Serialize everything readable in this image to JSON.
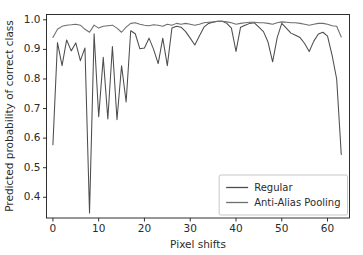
{
  "figure": {
    "background": "#ffffff",
    "axes_color": "#1a1a1a",
    "text_color": "#2b2b2b"
  },
  "chart_data": {
    "type": "line",
    "title": "",
    "xlabel": "Pixel shifts",
    "ylabel": "Predicted probability of correct class",
    "xlim": [
      -1.4,
      64.8
    ],
    "ylim": [
      0.33,
      1.018
    ],
    "xticks": [
      0,
      10,
      20,
      30,
      40,
      50,
      60
    ],
    "xticklabels": [
      "0",
      "10",
      "20",
      "30",
      "40",
      "50",
      "60"
    ],
    "yticks": [
      0.4,
      0.5,
      0.6,
      0.7,
      0.8,
      0.9,
      1.0
    ],
    "yticklabels": [
      "0.4",
      "0.5",
      "0.6",
      "0.7",
      "0.8",
      "0.9",
      "1.0"
    ],
    "grid": false,
    "legend_position": "lower right",
    "x": [
      0,
      1,
      2,
      3,
      4,
      5,
      6,
      7,
      8,
      9,
      10,
      11,
      12,
      13,
      14,
      15,
      16,
      17,
      18,
      19,
      20,
      21,
      22,
      23,
      24,
      25,
      26,
      27,
      28,
      29,
      30,
      31,
      32,
      33,
      34,
      35,
      36,
      37,
      38,
      39,
      40,
      41,
      42,
      43,
      44,
      45,
      46,
      47,
      48,
      49,
      50,
      51,
      52,
      53,
      54,
      55,
      56,
      57,
      58,
      59,
      60,
      61,
      62,
      63
    ],
    "series": [
      {
        "name": "Regular",
        "color": "#4d4d4d",
        "values": [
          0.578,
          0.923,
          0.845,
          0.932,
          0.895,
          0.922,
          0.862,
          0.905,
          0.347,
          0.953,
          0.672,
          0.873,
          0.665,
          0.91,
          0.662,
          0.845,
          0.722,
          0.963,
          0.953,
          0.902,
          0.905,
          0.938,
          0.9,
          0.852,
          0.938,
          0.845,
          0.972,
          0.978,
          0.975,
          0.96,
          0.938,
          0.915,
          0.945,
          0.975,
          0.988,
          0.992,
          0.995,
          0.995,
          0.988,
          0.972,
          0.893,
          0.975,
          0.982,
          0.988,
          0.99,
          0.975,
          0.96,
          0.925,
          0.858,
          0.94,
          0.988,
          0.972,
          0.955,
          0.948,
          0.94,
          0.92,
          0.893,
          0.928,
          0.952,
          0.958,
          0.945,
          0.88,
          0.8,
          0.545
        ],
        "legend_label": "Regular"
      },
      {
        "name": "Anti-Alias Pooling",
        "color": "#6e6e6e",
        "values": [
          0.94,
          0.968,
          0.978,
          0.982,
          0.983,
          0.985,
          0.982,
          0.968,
          0.958,
          0.982,
          0.972,
          0.978,
          0.98,
          0.982,
          0.972,
          0.958,
          0.975,
          0.988,
          0.99,
          0.985,
          0.982,
          0.98,
          0.983,
          0.982,
          0.978,
          0.985,
          0.982,
          0.988,
          0.985,
          0.988,
          0.985,
          0.982,
          0.985,
          0.99,
          0.992,
          0.993,
          0.995,
          0.995,
          0.993,
          0.99,
          0.985,
          0.988,
          0.99,
          0.992,
          0.992,
          0.99,
          0.99,
          0.988,
          0.985,
          0.99,
          0.993,
          0.992,
          0.99,
          0.99,
          0.988,
          0.985,
          0.982,
          0.985,
          0.988,
          0.988,
          0.985,
          0.98,
          0.978,
          0.942
        ],
        "legend_label": "Anti-Alias Pooling"
      }
    ]
  },
  "legend": {
    "items": [
      {
        "label": "Regular",
        "color": "#4d4d4d"
      },
      {
        "label": "Anti-Alias Pooling",
        "color": "#6e6e6e"
      }
    ]
  }
}
